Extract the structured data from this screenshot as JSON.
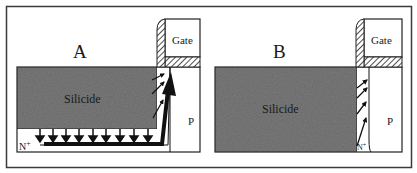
{
  "figure": {
    "panels": [
      {
        "id": "A",
        "label": "A",
        "gate_label": "Gate",
        "silicide_label": "Silicide",
        "substrate_label": "P",
        "junction_label": "N+",
        "junction_label_main": "N",
        "junction_label_sup": "+",
        "description": "Silicide with N+ junction underneath; current flows down from silicide and along N+ layer to channel"
      },
      {
        "id": "B",
        "label": "B",
        "gate_label": "Gate",
        "silicide_label": "Silicide",
        "substrate_label": "P",
        "junction_label": "N+",
        "junction_label_main": "N",
        "junction_label_sup": "+",
        "description": "Silicide extends to junction depth; current flows only through thin N+ sidewall region"
      }
    ],
    "colors": {
      "frame": "#3a3a3a",
      "silicide_fill": "#7a7a7a",
      "line": "#111111",
      "background": "#ffffff"
    }
  }
}
